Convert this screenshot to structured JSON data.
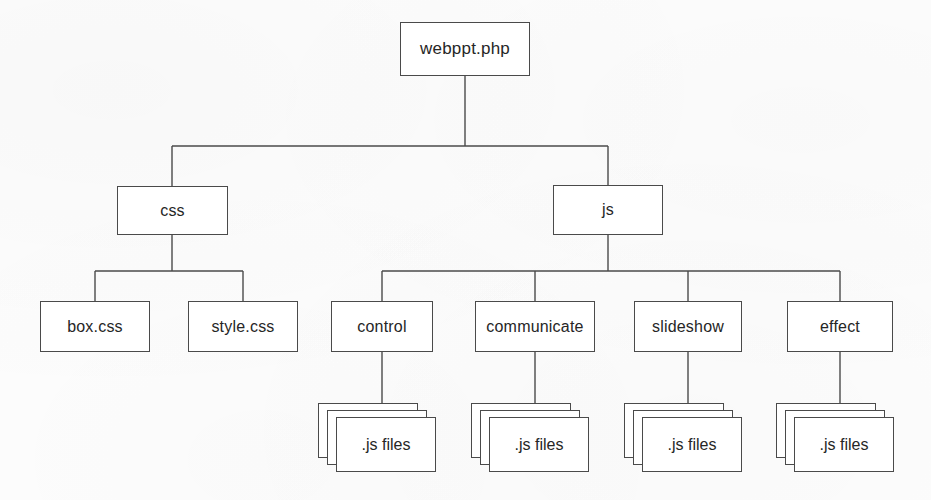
{
  "diagram": {
    "type": "tree",
    "stroke_color": "#4a4a4a",
    "background_color": "#fdfdfd",
    "text_color": "#262626",
    "root": {
      "label": "webppt.php"
    },
    "level2": [
      {
        "label": "css"
      },
      {
        "label": "js"
      }
    ],
    "css_children": [
      {
        "label": "box.css"
      },
      {
        "label": "style.css"
      }
    ],
    "js_children": [
      {
        "label": "control"
      },
      {
        "label": "communicate"
      },
      {
        "label": "slideshow"
      },
      {
        "label": "effect"
      }
    ],
    "file_stacks": [
      {
        "label": ".js files"
      },
      {
        "label": ".js files"
      },
      {
        "label": ".js files"
      },
      {
        "label": ".js files"
      }
    ]
  }
}
